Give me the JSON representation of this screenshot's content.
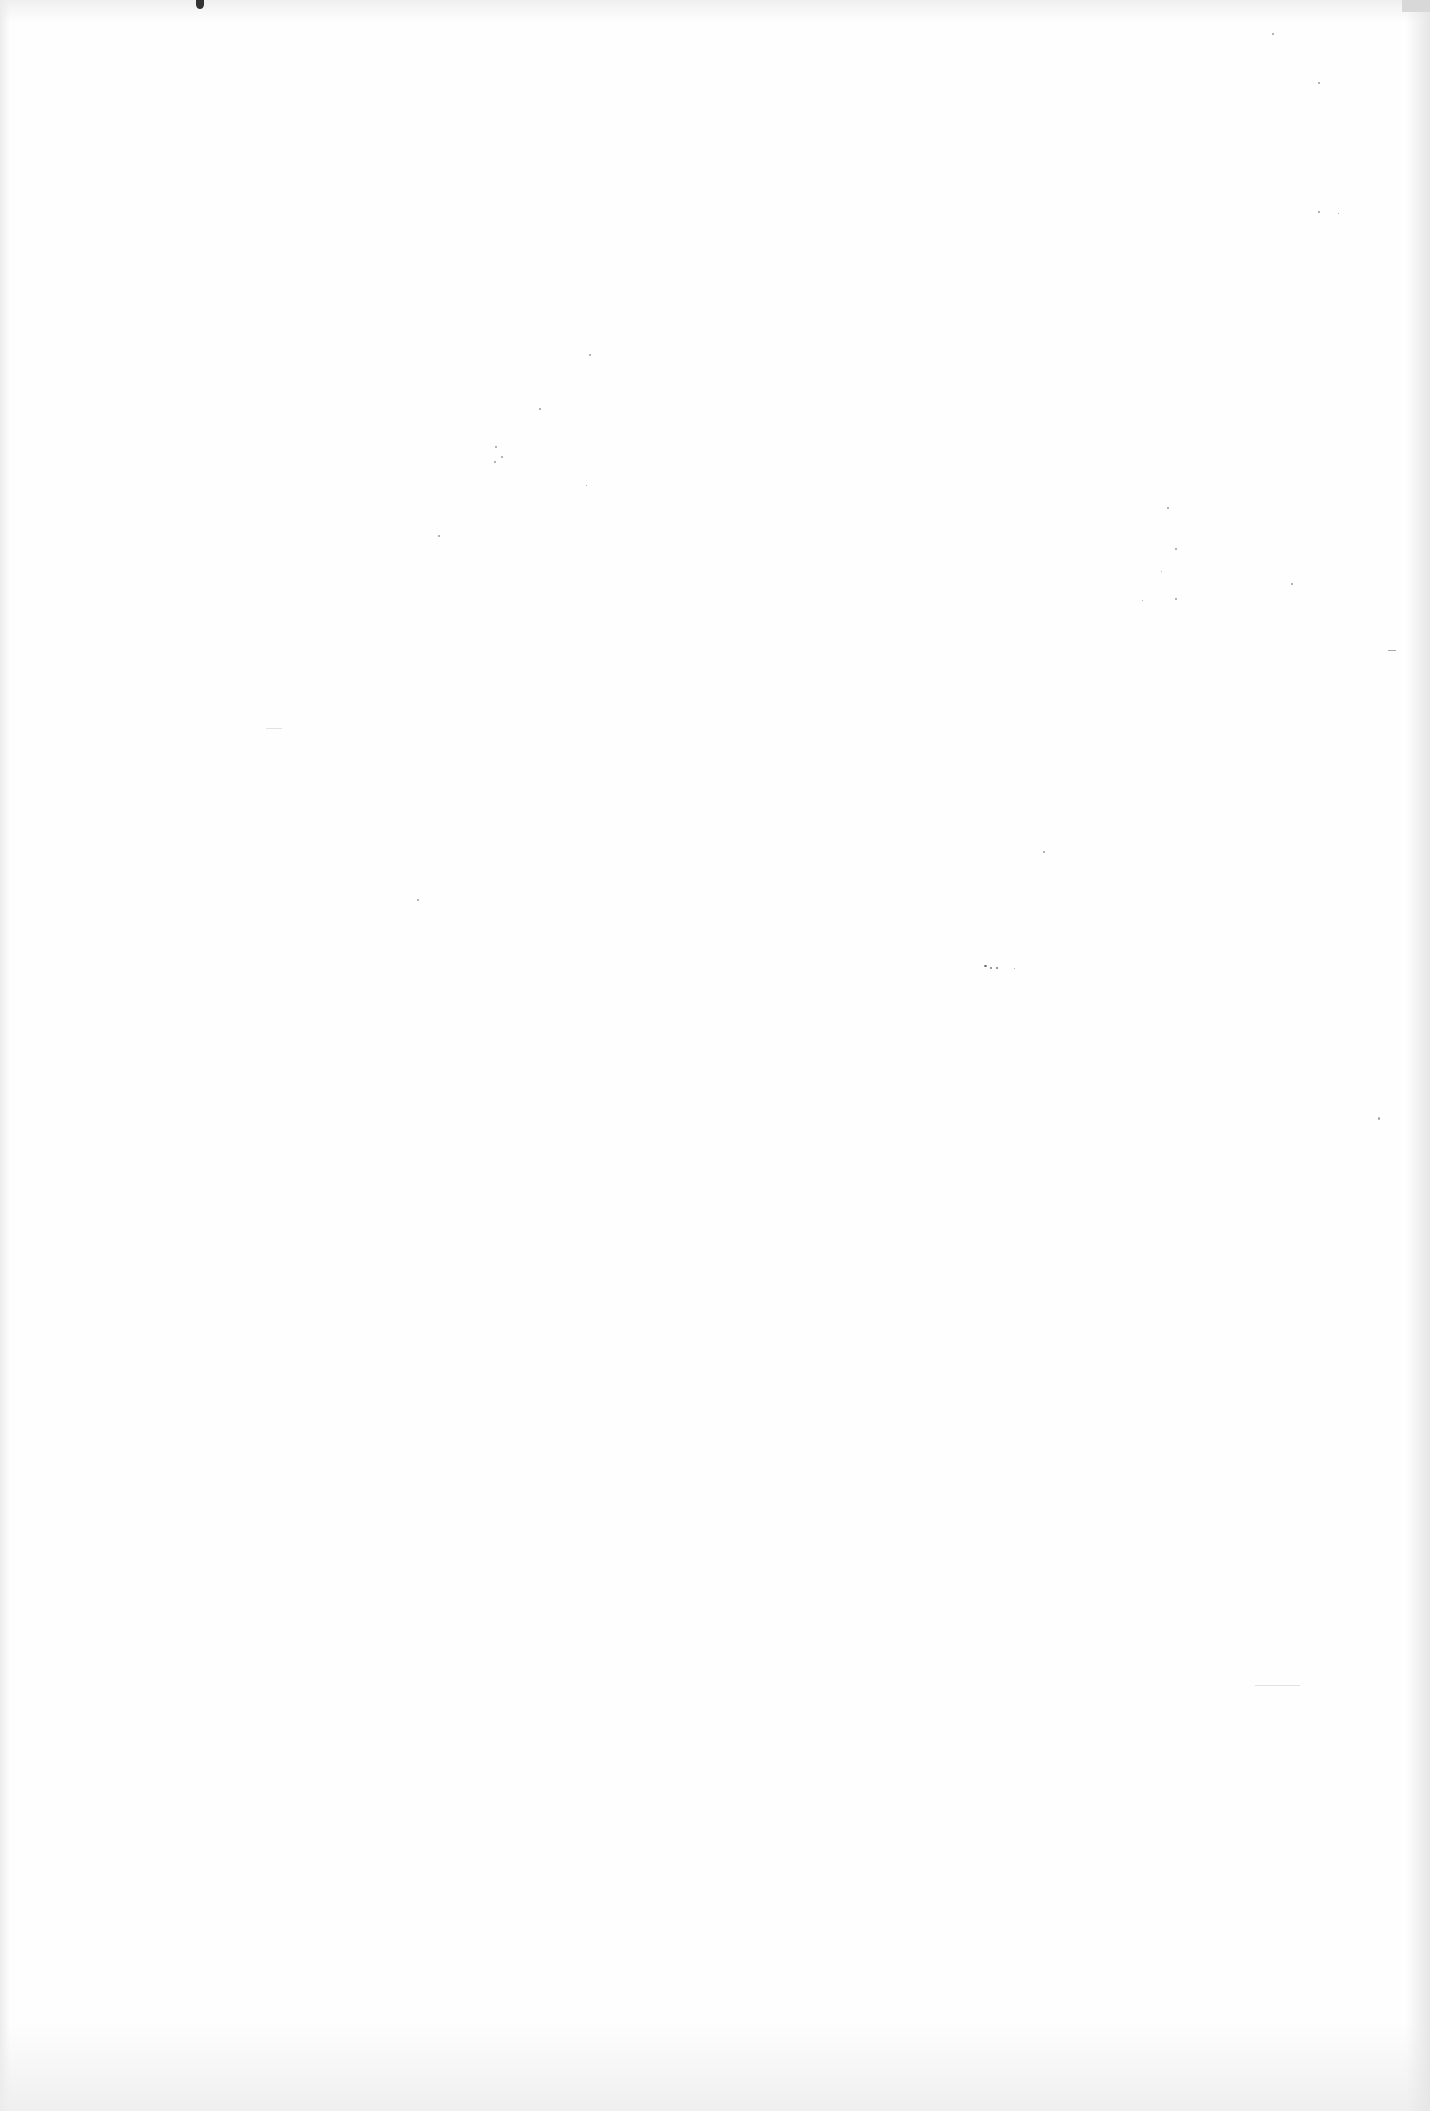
{
  "document": {
    "type": "blank scanned page",
    "text_content": "",
    "background_color": "#fefefe",
    "artifacts": [
      {
        "kind": "ink-blot",
        "position": "top-left edge"
      },
      {
        "kind": "speck-cluster",
        "position": "upper-left-center"
      },
      {
        "kind": "speck-cluster",
        "position": "right-middle"
      },
      {
        "kind": "speck-cluster",
        "position": "center"
      }
    ]
  }
}
